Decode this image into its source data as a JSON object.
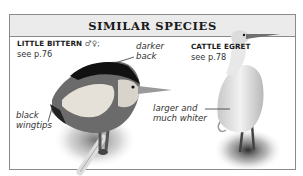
{
  "panel": {
    "title": "SIMILAR SPECIES"
  },
  "species": [
    {
      "name": "LITTLE BITTERN",
      "sex_symbols": "♂♀;",
      "reference": "see p.76",
      "annotations": [
        {
          "text_line1": "darker",
          "text_line2": "back"
        },
        {
          "text_line1": "black",
          "text_line2": "wingtips"
        }
      ]
    },
    {
      "name": "CATTLE EGRET",
      "reference": "see p.78",
      "annotations": [
        {
          "text_line1": "larger and",
          "text_line2": "much whiter"
        }
      ]
    }
  ],
  "colors": {
    "header_bg": "#ebebeb",
    "border": "#8a8a8a",
    "text": "#1a1a1a"
  }
}
